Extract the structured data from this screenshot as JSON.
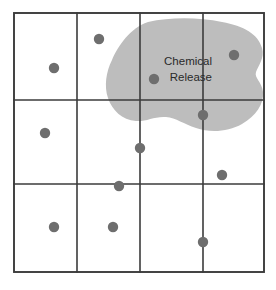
{
  "diagram": {
    "type": "map-diagram",
    "canvas": {
      "width": 276,
      "height": 290
    },
    "background_color": "#ffffff"
  },
  "grid": {
    "name": "sampling-grid",
    "columns": 4,
    "rows": 3,
    "line_color": "#3b3b3b",
    "border_color": "#3b3b3b",
    "bounds": {
      "x0": 14,
      "y0": 13,
      "x1": 264,
      "y1": 272
    },
    "vertical_lines_x": [
      14,
      77,
      140,
      203,
      264
    ],
    "horizontal_lines_y": [
      13,
      100,
      184,
      272
    ]
  },
  "plume": {
    "name": "chemical-release-plume",
    "fill_color": "#bdbdbd",
    "label_lines": [
      "Chemical",
      "Release"
    ],
    "label_line_1": "Chemical",
    "label_line_2": "Release",
    "label_color": "#2a2a2a",
    "label_anchor": {
      "x": 212,
      "y": 62
    },
    "label_line_height": 16,
    "path": "M 148 22 C 170 17, 198 17, 222 22 C 244 26, 258 34, 262 48 C 265 58, 258 66, 256 72 C 254 78, 262 82, 263 92 C 264 104, 256 116, 242 124 C 228 132, 210 133, 196 128 C 184 124, 176 118, 166 117 C 154 116, 146 122, 136 121 C 122 120, 112 110, 108 98 C 104 86, 106 72, 112 60 C 118 46, 130 28, 148 22 Z"
  },
  "dots": {
    "name": "monitoring-sites",
    "color": "#6e6e6e",
    "radius": 5.2,
    "points": [
      {
        "id": "site-1",
        "x": 54,
        "y": 68
      },
      {
        "id": "site-2",
        "x": 99,
        "y": 39
      },
      {
        "id": "site-3",
        "x": 234,
        "y": 55
      },
      {
        "id": "site-4",
        "x": 154,
        "y": 79
      },
      {
        "id": "site-5",
        "x": 45,
        "y": 133
      },
      {
        "id": "site-6",
        "x": 203,
        "y": 115
      },
      {
        "id": "site-7",
        "x": 140,
        "y": 148
      },
      {
        "id": "site-8",
        "x": 222,
        "y": 175
      },
      {
        "id": "site-9",
        "x": 119,
        "y": 186
      },
      {
        "id": "site-10",
        "x": 54,
        "y": 227
      },
      {
        "id": "site-11",
        "x": 113,
        "y": 227
      },
      {
        "id": "site-12",
        "x": 203,
        "y": 242
      }
    ]
  }
}
